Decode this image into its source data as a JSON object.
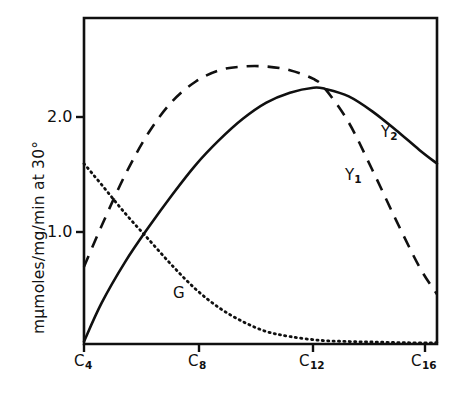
{
  "chart_data": {
    "type": "line",
    "title": "",
    "xlabel": "",
    "ylabel": "mμmoles/mg/min at 30°",
    "x_tick_labels": [
      "C4",
      "C8",
      "C12",
      "C16"
    ],
    "x_tick_values": [
      4,
      8,
      12,
      16
    ],
    "y_tick_labels": [
      "1.0",
      "2.0"
    ],
    "y_tick_values": [
      1.0,
      2.0
    ],
    "xlim": [
      4,
      16
    ],
    "ylim": [
      0,
      2.62
    ],
    "grid": false,
    "legend": "inline-curve-labels",
    "series": [
      {
        "name": "Y2",
        "label": "Y2",
        "style": "solid",
        "x": [
          4,
          4.6,
          5.4,
          6.2,
          7,
          7.8,
          8.6,
          9.4,
          10.2,
          11,
          11.8,
          12.2,
          13,
          13.8,
          14.6,
          15.4,
          16
        ],
        "values": [
          0.02,
          0.33,
          0.66,
          0.94,
          1.2,
          1.44,
          1.64,
          1.81,
          1.94,
          2.02,
          2.06,
          2.05,
          1.99,
          1.87,
          1.72,
          1.56,
          1.45
        ]
      },
      {
        "name": "Y1",
        "label": "Y1",
        "style": "dashed",
        "x": [
          4,
          4.6,
          5.4,
          6.2,
          7,
          7.8,
          8.6,
          9.4,
          10.2,
          11,
          11.8,
          12.2,
          13,
          13.8,
          14.6,
          15.4,
          16
        ],
        "values": [
          0.62,
          0.95,
          1.36,
          1.7,
          1.95,
          2.11,
          2.2,
          2.23,
          2.23,
          2.2,
          2.13,
          2.05,
          1.78,
          1.4,
          1.0,
          0.62,
          0.4
        ]
      },
      {
        "name": "G",
        "label": "G",
        "style": "dotted",
        "x": [
          4,
          4.6,
          5.4,
          6.2,
          7,
          7.8,
          8.6,
          9.4,
          10.2,
          11,
          12,
          13,
          14,
          15,
          16
        ],
        "values": [
          1.45,
          1.28,
          1.05,
          0.84,
          0.63,
          0.44,
          0.29,
          0.18,
          0.1,
          0.06,
          0.03,
          0.02,
          0.015,
          0.01,
          0.01
        ]
      }
    ],
    "curve_labels": [
      {
        "text": "Y2",
        "x_px": 381,
        "y_px": 131
      },
      {
        "text": "Y1",
        "x_px": 349,
        "y_px": 174
      },
      {
        "text": "G",
        "x_px": 178,
        "y_px": 292
      }
    ],
    "colors": {
      "line": "#101010",
      "frame": "#101010",
      "background": "#ffffff"
    }
  }
}
